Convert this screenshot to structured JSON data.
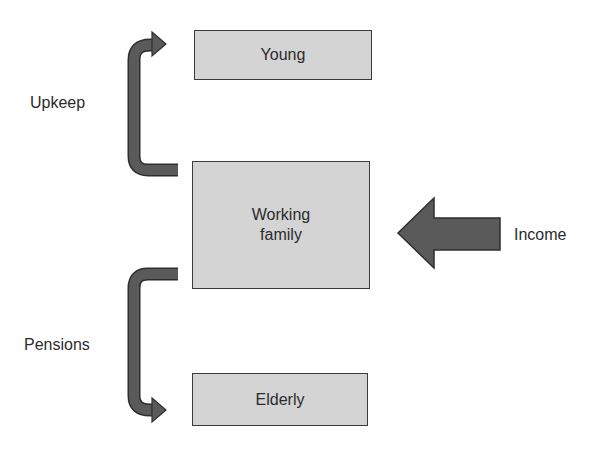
{
  "diagram": {
    "nodes": {
      "young": {
        "label": "Young"
      },
      "working_family": {
        "label_line1": "Working",
        "label_line2": "family"
      },
      "elderly": {
        "label": "Elderly"
      }
    },
    "edges": {
      "upkeep": {
        "label": "Upkeep",
        "from": "Working family",
        "to": "Young"
      },
      "pensions": {
        "label": "Pensions",
        "from": "Working family",
        "to": "Elderly"
      },
      "income": {
        "label": "Income",
        "to": "Working family"
      }
    },
    "colors": {
      "box_fill": "#d4d4d4",
      "box_border": "#3a3a3a",
      "arrow_fill": "#5a5a5a",
      "arrow_stroke": "#2e2e2e"
    }
  }
}
